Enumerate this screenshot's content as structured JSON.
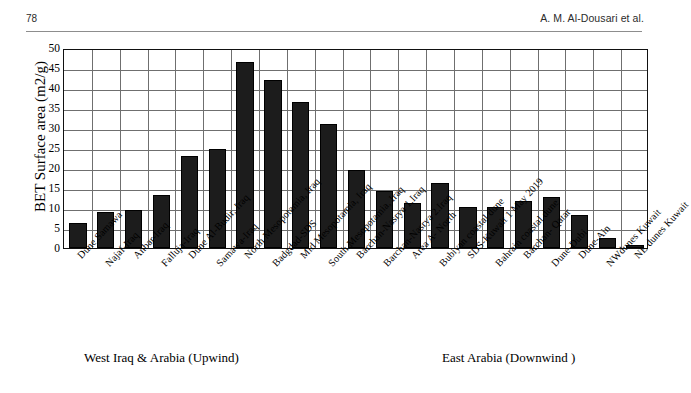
{
  "header": {
    "page_number": "78",
    "running_head": "A. M. Al-Dousari et al."
  },
  "chart_data": {
    "type": "bar",
    "title": "",
    "xlabel": "",
    "ylabel": "BET Surface area (m2/g)",
    "ylim": [
      0,
      50
    ],
    "ytick_step": 5,
    "yticks": [
      "50",
      "45",
      "40",
      "35",
      "30",
      "25",
      "20",
      "15",
      "10",
      "5",
      "0"
    ],
    "grid": "both",
    "legend": "none",
    "bar_color": "#1c1c1c",
    "categories": [
      "Dune Samawa",
      "Najaf-Iraq",
      "Anbar-Iraq",
      "Falluja-Iraq",
      "Dune Al-Budir, Iraq",
      "Samawa-Iraq",
      "North Mesopotamia, Iraq",
      "Badgdad-SDS",
      "Mid Mesopotamia, Iraq",
      "South Mesopotamia, Iraq",
      "Barchan-Nasrya 1.Iraq",
      "Barchan-Nasrya 2.Iraq",
      "Area A- North",
      "Bubiyan coastal dune",
      "SDS-Kuwait 1 May 2019",
      "Bahrain coastal dune",
      "Barchan- Qatar",
      "Dune-Dubi",
      "Dune-Ain",
      "NWdunes Kuwait",
      "NE dunes Kuwait"
    ],
    "values": [
      6.2,
      9.0,
      9.6,
      13.3,
      23.0,
      24.7,
      46.4,
      41.9,
      36.5,
      31.0,
      19.5,
      14.3,
      11.2,
      16.3,
      10.3,
      10.2,
      11.8,
      12.7,
      8.2,
      2.6,
      0.8
    ]
  },
  "annotations": {
    "group_upwind": "West Iraq & Arabia (Upwind)",
    "group_downwind": "East Arabia (Downwind )"
  }
}
